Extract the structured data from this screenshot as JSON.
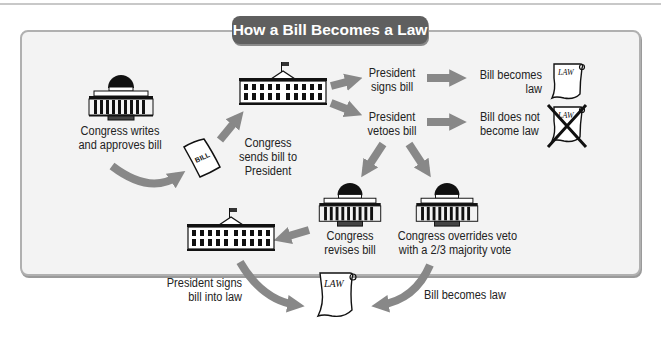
{
  "title": "How a Bill Becomes a Law",
  "colors": {
    "title_bg": "#5f5f5f",
    "panel_bg": "#f3f3f3",
    "panel_border": "#b0b0b0",
    "arrow": "#888888",
    "text": "#222222"
  },
  "nodes": {
    "congress_writes": {
      "label_line1": "Congress writes",
      "label_line2": "and approves bill",
      "icon": "capitol-icon"
    },
    "bill_document": {
      "text": "BILL",
      "icon": "bill-scroll-icon"
    },
    "sends_to_president": {
      "label_line1": "Congress",
      "label_line2": "sends bill to",
      "label_line3": "President",
      "icon": "white-house-icon"
    },
    "president_signs": {
      "label_line1": "President",
      "label_line2": "signs bill"
    },
    "president_vetoes": {
      "label_line1": "President",
      "label_line2": "vetoes bill"
    },
    "bill_becomes_law": {
      "label_line1": "Bill becomes",
      "label_line2": "law",
      "scroll_text": "LAW",
      "icon": "law-scroll-icon"
    },
    "bill_not_law": {
      "label_line1": "Bill does not",
      "label_line2": "become law",
      "scroll_text": "LAW",
      "icon": "crossed-law-scroll-icon"
    },
    "congress_revises": {
      "label_line1": "Congress",
      "label_line2": "revises bill",
      "icon": "capitol-icon"
    },
    "congress_overrides": {
      "label_line1": "Congress overrides veto",
      "label_line2": "with a 2/3 majority vote",
      "icon": "capitol-icon"
    },
    "president_signs_into_law": {
      "label_line1": "President signs",
      "label_line2": "bill into law",
      "icon": "white-house-icon"
    },
    "final_law": {
      "scroll_text": "LAW",
      "icon": "law-scroll-icon"
    },
    "override_becomes_law": {
      "label": "Bill becomes law"
    }
  }
}
